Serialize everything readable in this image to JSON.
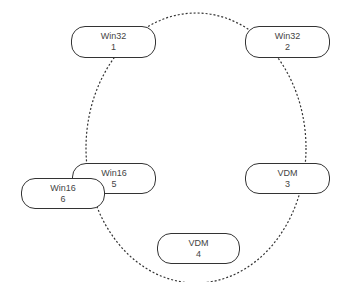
{
  "diagram": {
    "type": "ring",
    "ring_style": "dotted",
    "nodes": [
      {
        "id": 1,
        "label": "Win32",
        "number": "1"
      },
      {
        "id": 2,
        "label": "Win32",
        "number": "2"
      },
      {
        "id": 3,
        "label": "VDM",
        "number": "3"
      },
      {
        "id": 4,
        "label": "VDM",
        "number": "4"
      },
      {
        "id": 5,
        "label": "Win16",
        "number": "5"
      },
      {
        "id": 6,
        "label": "Win16",
        "number": "6"
      }
    ]
  }
}
